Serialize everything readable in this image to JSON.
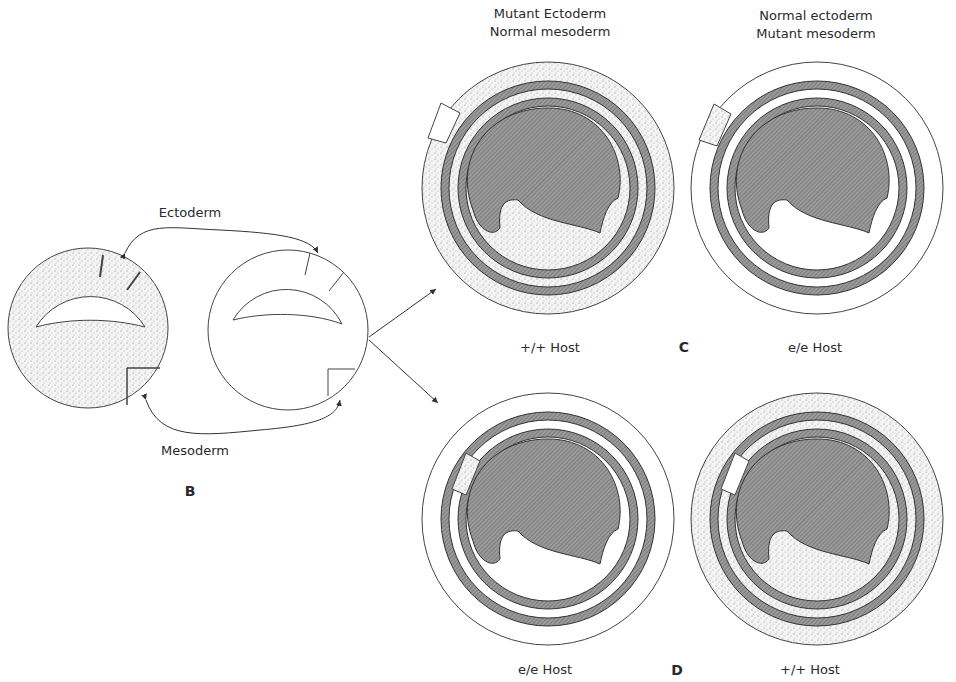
{
  "figure": {
    "panel_b": {
      "letter": "B",
      "ectoderm_label": "Ectoderm",
      "mesoderm_label": "Mesoderm"
    },
    "columns": {
      "left_header_line1": "Mutant Ectoderm",
      "left_header_line2": "Normal mesoderm",
      "right_header_line1": "Normal ectoderm",
      "right_header_line2": "Mutant mesoderm"
    },
    "panel_c": {
      "letter": "C",
      "left_host": "+/+ Host",
      "right_host": "e/e Host"
    },
    "panel_d": {
      "letter": "D",
      "left_host": "e/e Host",
      "right_host": "+/+ Host"
    },
    "colors": {
      "line": "#333333",
      "hatch": "#777777",
      "stipple": "#999999",
      "background": "#ffffff"
    }
  }
}
